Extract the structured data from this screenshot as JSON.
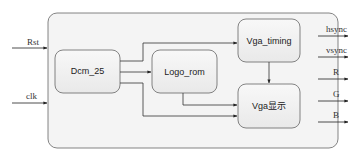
{
  "diagram": {
    "inputs": [
      {
        "label": "Rst"
      },
      {
        "label": "clk"
      }
    ],
    "outputs": [
      {
        "label": "hsync"
      },
      {
        "label": "vsync"
      },
      {
        "label": "R"
      },
      {
        "label": "G"
      },
      {
        "label": "B"
      }
    ],
    "blocks": {
      "dcm": {
        "label": "Dcm_25"
      },
      "logo_rom": {
        "label": "Logo_rom"
      },
      "vga_timing": {
        "label": "Vga_timing"
      },
      "vga_display": {
        "label": "Vga显示"
      }
    },
    "colors": {
      "outer_fill": "#f3f3f3",
      "block_fill": "#efefef",
      "stroke": "#555555"
    }
  }
}
